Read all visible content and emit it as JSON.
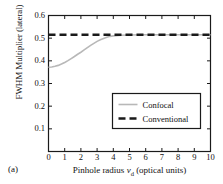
{
  "figure": {
    "panel_label": "(a)",
    "background": "#ffffff",
    "axis_color": "#1a1a1a"
  },
  "chart_data": {
    "type": "line",
    "title": "",
    "xlabel": "Pinhole radius v_d (optical units)",
    "xlabel_parts": {
      "prefix": "Pinhole radius ",
      "symbol": "v",
      "subscript": "d",
      "suffix": " (optical units)"
    },
    "ylabel": "FWHM Multiplier (lateral)",
    "xlim": [
      0,
      10
    ],
    "ylim": [
      0,
      0.6
    ],
    "xticks": [
      0,
      1,
      2,
      3,
      4,
      5,
      6,
      7,
      8,
      9,
      10
    ],
    "xtick_labels": [
      "0",
      "1",
      "2",
      "3",
      "4",
      "5",
      "6",
      "7",
      "8",
      "9",
      "10"
    ],
    "yticks": [
      0.1,
      0.2,
      0.3,
      0.4,
      0.5,
      0.6
    ],
    "ytick_labels": [
      "0.1",
      "0.2",
      "0.3",
      "0.4",
      "0.5",
      "0.6"
    ],
    "grid": false,
    "legend_position": "center-right",
    "series": [
      {
        "name": "Confocal",
        "style": "solid",
        "color": "#b8b8b8",
        "width": 1.6,
        "x": [
          0.0,
          0.2,
          0.4,
          0.6,
          0.8,
          1.0,
          1.2,
          1.4,
          1.6,
          1.8,
          2.0,
          2.2,
          2.4,
          2.6,
          2.8,
          3.0,
          3.2,
          3.4,
          3.6,
          3.8,
          4.0,
          4.5,
          5.0,
          6.0,
          7.0,
          8.0,
          9.0,
          10.0
        ],
        "values": [
          0.372,
          0.373,
          0.376,
          0.38,
          0.386,
          0.393,
          0.401,
          0.41,
          0.419,
          0.429,
          0.438,
          0.448,
          0.458,
          0.468,
          0.477,
          0.486,
          0.493,
          0.499,
          0.504,
          0.508,
          0.51,
          0.513,
          0.514,
          0.515,
          0.515,
          0.515,
          0.515,
          0.515
        ]
      },
      {
        "name": "Conventional",
        "style": "dashed",
        "color": "#1a1a1a",
        "width": 2.4,
        "x": [
          0,
          10
        ],
        "values": [
          0.515,
          0.515
        ]
      }
    ],
    "legend": [
      {
        "label": "Confocal",
        "style": "solid",
        "color": "#b8b8b8"
      },
      {
        "label": "Conventional",
        "style": "dashed",
        "color": "#1a1a1a"
      }
    ]
  }
}
